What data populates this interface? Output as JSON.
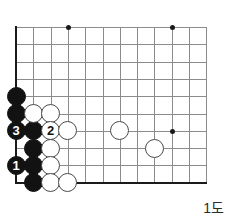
{
  "figure": {
    "caption": "1도",
    "kind": "go-board-diagram"
  },
  "board": {
    "geometry": {
      "origin_x": 16,
      "origin_y": 27,
      "spacing": 17.3,
      "cols_visible": 12,
      "rows_visible": 10,
      "left_edge_is_border": true,
      "bottom_edge_is_border": true,
      "top_edge_is_border": false,
      "right_edge_is_border": false
    },
    "colors": {
      "grid": "#8c8c8c",
      "border": "#1a1a1a",
      "black_stone": "#121212",
      "white_stone": "#ffffff",
      "white_stone_outline": "#4a4a4a",
      "background": "#ffffff"
    },
    "star_points": [
      {
        "col": 4,
        "row": 1
      },
      {
        "col": 10,
        "row": 1
      },
      {
        "col": 10,
        "row": 7
      }
    ],
    "stones": [
      {
        "col": 1,
        "row": 5,
        "color": "black",
        "label": ""
      },
      {
        "col": 1,
        "row": 6,
        "color": "black",
        "label": ""
      },
      {
        "col": 1,
        "row": 7,
        "color": "black",
        "label": "3"
      },
      {
        "col": 2,
        "row": 7,
        "color": "black",
        "label": ""
      },
      {
        "col": 2,
        "row": 8,
        "color": "black",
        "label": ""
      },
      {
        "col": 1,
        "row": 9,
        "color": "black",
        "label": "1"
      },
      {
        "col": 2,
        "row": 9,
        "color": "black",
        "label": ""
      },
      {
        "col": 2,
        "row": 10,
        "color": "black",
        "label": ""
      },
      {
        "col": 2,
        "row": 6,
        "color": "white",
        "label": ""
      },
      {
        "col": 3,
        "row": 6,
        "color": "white",
        "label": ""
      },
      {
        "col": 3,
        "row": 7,
        "color": "white",
        "label": "2"
      },
      {
        "col": 4,
        "row": 7,
        "color": "white",
        "label": ""
      },
      {
        "col": 3,
        "row": 8,
        "color": "white",
        "label": ""
      },
      {
        "col": 3,
        "row": 9,
        "color": "white",
        "label": ""
      },
      {
        "col": 3,
        "row": 10,
        "color": "white",
        "label": ""
      },
      {
        "col": 4,
        "row": 10,
        "color": "white",
        "label": ""
      },
      {
        "col": 7,
        "row": 7,
        "color": "white",
        "label": ""
      },
      {
        "col": 9,
        "row": 8,
        "color": "white",
        "label": ""
      }
    ]
  }
}
